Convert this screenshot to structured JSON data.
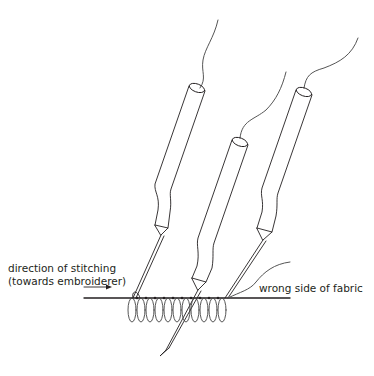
{
  "diagram": {
    "labels": {
      "direction_line1": "direction of stitching",
      "direction_line2": "(towards embroiderer)",
      "fabric": "wrong side of fabric"
    },
    "elements": [
      "tambour-hook-left",
      "tambour-hook-middle",
      "tambour-hook-right",
      "thread-loops",
      "fabric-line",
      "direction-arrow"
    ],
    "colors": {
      "stroke": "#231f20",
      "thread": "#555555",
      "background": "#ffffff"
    }
  }
}
